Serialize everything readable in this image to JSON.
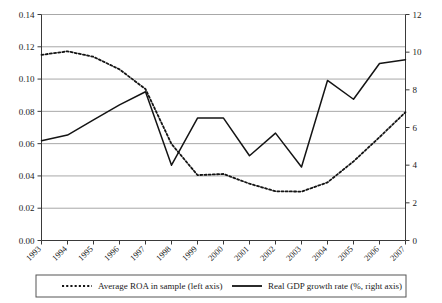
{
  "chart_data": {
    "type": "line",
    "title": "",
    "subtitle": "",
    "xlabel": "",
    "ylabel": "",
    "grid": true,
    "legend_position": "bottom",
    "categories": [
      "1993",
      "1994",
      "1995",
      "1996",
      "1997",
      "1998",
      "1999",
      "2000",
      "2001",
      "2002",
      "2003",
      "2004",
      "2005",
      "2006",
      "2007"
    ],
    "axes": {
      "left": {
        "label": "Average ROA in sample",
        "ylim": [
          0.0,
          0.14
        ],
        "tick_step": 0.02,
        "tick_labels": [
          "0.00",
          "0.02",
          "0.04",
          "0.06",
          "0.08",
          "0.10",
          "0.12",
          "0.14"
        ],
        "tick_values": [
          0.0,
          0.02,
          0.04,
          0.06,
          0.08,
          0.1,
          0.12,
          0.14
        ]
      },
      "right": {
        "label": "Real GDP growth rate (%)",
        "ylim": [
          0,
          12
        ],
        "tick_step": 2,
        "tick_labels": [
          "0",
          "2",
          "4",
          "6",
          "8",
          "10",
          "12"
        ],
        "tick_values": [
          0,
          2,
          4,
          6,
          8,
          10,
          12
        ]
      }
    },
    "series": [
      {
        "name": "Average ROA in sample (left axis)",
        "axis": "left",
        "style": "dotted",
        "color": "#141414",
        "values": [
          0.115,
          0.1172,
          0.1138,
          0.106,
          0.0938,
          0.0598,
          0.0405,
          0.0412,
          0.0352,
          0.0305,
          0.0303,
          0.036,
          0.049,
          0.064,
          0.0795
        ]
      },
      {
        "name": "Real GDP growth rate (%, right axis)",
        "axis": "right",
        "style": "solid",
        "color": "#141414",
        "values": [
          5.3,
          5.6,
          6.4,
          7.2,
          7.9,
          4.0,
          6.5,
          6.5,
          4.5,
          5.7,
          3.9,
          8.5,
          7.5,
          9.4,
          9.6
        ]
      }
    ],
    "legend": [
      {
        "label": "Average ROA in sample (left axis)",
        "style": "dotted"
      },
      {
        "label": "Real GDP growth rate (%, right axis)",
        "style": "solid"
      }
    ]
  }
}
